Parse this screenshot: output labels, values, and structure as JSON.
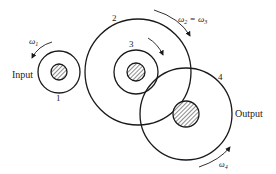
{
  "diagram": {
    "type": "compound gear train",
    "gears": [
      {
        "id": "1",
        "label": "1"
      },
      {
        "id": "2",
        "label": "2"
      },
      {
        "id": "3",
        "label": "3"
      },
      {
        "id": "4",
        "label": "4"
      }
    ],
    "labels": {
      "input": "Input",
      "output": "Output",
      "omega1": "ω",
      "omega1_sub": "1",
      "omega23_a": "ω",
      "omega23_a_sub": "2",
      "omega23_eq": " = ω",
      "omega23_b_sub": "3",
      "omega4": "ω",
      "omega4_sub": "4"
    },
    "colors": {
      "stroke": "#1a1a1a",
      "background": "#ffffff"
    }
  }
}
